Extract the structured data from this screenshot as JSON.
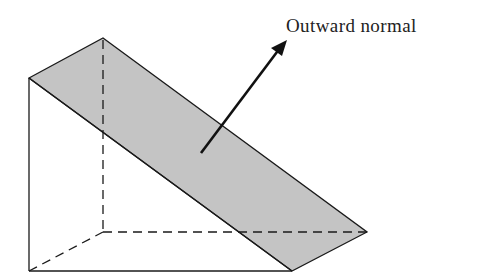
{
  "figure": {
    "type": "triangular-prism-with-inclined-face",
    "label": "Outward normal",
    "colors": {
      "background": "#ffffff",
      "shaded_face": "#c4c4c4",
      "lines": "#1a1a1a"
    },
    "vertices": {
      "front_top_left": [
        29,
        78
      ],
      "back_top_left": [
        103,
        38
      ],
      "front_bottom_left": [
        29,
        271
      ],
      "back_bottom_left": [
        103,
        232
      ],
      "back_bottom_right": [
        367,
        232
      ],
      "front_bottom_right": [
        292,
        271
      ]
    },
    "arrow": {
      "from": [
        201,
        153
      ],
      "to": [
        283,
        44
      ]
    }
  }
}
